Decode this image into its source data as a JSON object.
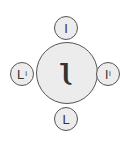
{
  "diagram": {
    "center": {
      "glyph": "ι",
      "label": "ɩ"
    },
    "satellites": {
      "top": {
        "glyph": "I"
      },
      "left": {
        "glyph": "L",
        "suffix": "i"
      },
      "right": {
        "glyph": "l",
        "suffix": "i"
      },
      "bottom": {
        "glyph": "L"
      }
    },
    "colors": {
      "fill": "#ececec",
      "stroke": "#555555",
      "text": "#333333",
      "background": "#ffffff"
    }
  }
}
